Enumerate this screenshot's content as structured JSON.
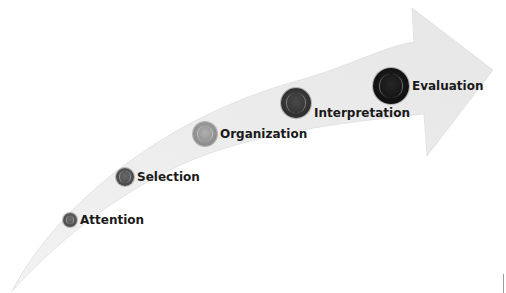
{
  "diagram": {
    "type": "curved-arrow-process",
    "arrow_color": "#ececec",
    "steps": [
      {
        "label": "Attention",
        "color": "#5a5a5a",
        "size": 14,
        "x": 63,
        "y": 213
      },
      {
        "label": "Selection",
        "color": "#555555",
        "size": 18,
        "x": 116,
        "y": 168
      },
      {
        "label": "Organization",
        "color": "#9a9a9a",
        "size": 24,
        "x": 193,
        "y": 122
      },
      {
        "label": "Interpretation",
        "color": "#3a3a3a",
        "size": 30,
        "x": 281,
        "y": 88
      },
      {
        "label": "Evaluation",
        "color": "#141414",
        "size": 36,
        "x": 373,
        "y": 68
      }
    ]
  }
}
